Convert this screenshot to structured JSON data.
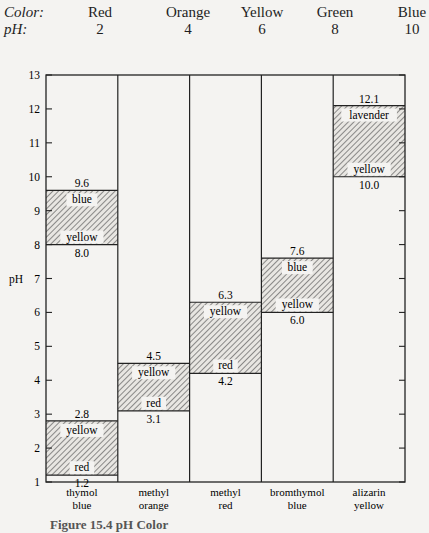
{
  "header": {
    "color_key": "Color:",
    "ph_key": "pH:",
    "scale": [
      {
        "color": "Red",
        "ph": "2"
      },
      {
        "color": "Orange",
        "ph": "4"
      },
      {
        "color": "Yellow",
        "ph": "6"
      },
      {
        "color": "Green",
        "ph": "8"
      },
      {
        "color": "Blue",
        "ph": "10"
      }
    ]
  },
  "caption": "Figure 15.4   pH Color",
  "chart_data": {
    "type": "bar",
    "subtype": "floating-range",
    "title": "",
    "xlabel": "",
    "ylabel": "pH",
    "ylim": [
      1,
      13
    ],
    "yticks": [
      1,
      2,
      3,
      4,
      5,
      6,
      7,
      8,
      9,
      10,
      11,
      12,
      13
    ],
    "grid": false,
    "categories": [
      "thymol blue",
      "methyl orange",
      "methyl red",
      "bromthymol blue",
      "alizarin yellow"
    ],
    "category_labels": [
      [
        "thymol",
        "blue"
      ],
      [
        "methyl",
        "orange"
      ],
      [
        "methyl",
        "red"
      ],
      [
        "bromthymol",
        "blue"
      ],
      [
        "alizarin",
        "yellow"
      ]
    ],
    "ranges": [
      {
        "low": 1.2,
        "high": 2.8,
        "low_color": "red",
        "high_color": "yellow"
      },
      {
        "low": 3.1,
        "high": 4.5,
        "low_color": "red",
        "high_color": "yellow"
      },
      {
        "low": 4.2,
        "high": 6.3,
        "low_color": "red",
        "high_color": "yellow"
      },
      {
        "low": 6.0,
        "high": 7.6,
        "low_color": "yellow",
        "high_color": "blue"
      },
      {
        "low": 10.0,
        "high": 12.1,
        "low_color": "yellow",
        "high_color": "lavender"
      }
    ],
    "ranges_secondary": [
      {
        "category": "thymol blue",
        "low": 8.0,
        "high": 9.6,
        "low_color": "yellow",
        "high_color": "blue"
      }
    ],
    "value_labels": {
      "thymol blue": [
        "1.2",
        "2.8",
        "8.0",
        "9.6"
      ],
      "methyl orange": [
        "3.1",
        "4.5"
      ],
      "methyl red": [
        "4.2",
        "6.3"
      ],
      "bromthymol blue": [
        "6.0",
        "7.6"
      ],
      "alizarin yellow": [
        "10.0",
        "12.1"
      ]
    }
  }
}
